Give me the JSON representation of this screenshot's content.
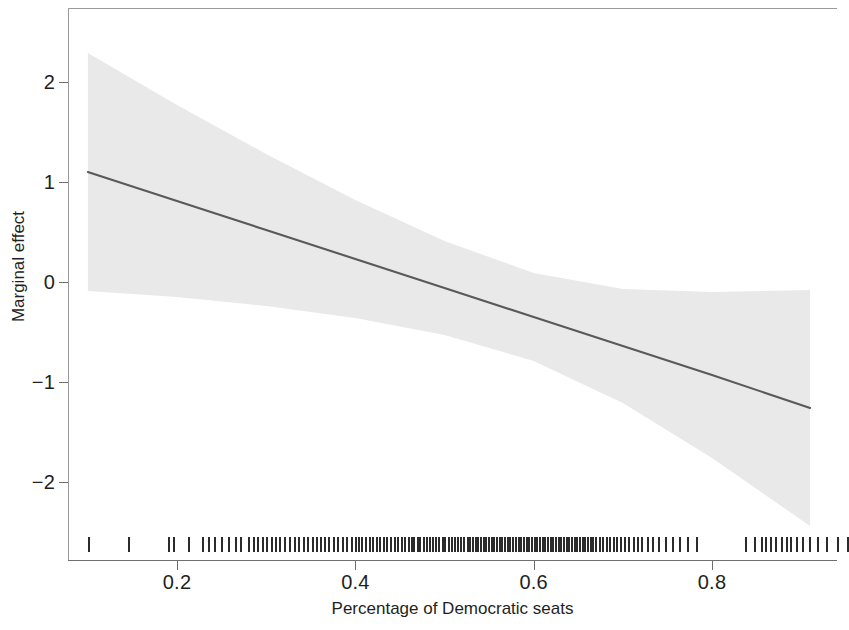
{
  "chart_data": {
    "type": "line",
    "title": "",
    "subtitle": "",
    "xlabel": "Percentage of Democratic seats",
    "ylabel": "Marginal effect",
    "xlim": [
      0.093,
      0.958
    ],
    "ylim": [
      -2.72,
      2.64
    ],
    "xticks": [
      0.2,
      0.4,
      0.6,
      0.8
    ],
    "xtick_labels": [
      "0.2",
      "0.4",
      "0.6",
      "0.8"
    ],
    "yticks": [
      2,
      1,
      0,
      -1,
      -2
    ],
    "ytick_labels": [
      "2",
      "1",
      "0",
      "-1",
      "-2"
    ],
    "grid": false,
    "legend": null,
    "line_color": "#59595b",
    "band_color": "#e9e9e9",
    "series": [
      {
        "name": "Marginal effect",
        "type": "line",
        "x": [
          0.1,
          0.2,
          0.3,
          0.4,
          0.5,
          0.6,
          0.7,
          0.8,
          0.91
        ],
        "values": [
          1.1,
          0.81,
          0.52,
          0.23,
          -0.06,
          -0.35,
          -0.64,
          -0.93,
          -1.26
        ]
      },
      {
        "name": "95% confidence interval upper",
        "type": "band_upper",
        "x": [
          0.1,
          0.2,
          0.3,
          0.4,
          0.5,
          0.6,
          0.7,
          0.8,
          0.91
        ],
        "values": [
          2.29,
          1.77,
          1.28,
          0.82,
          0.41,
          0.09,
          -0.07,
          -0.1,
          -0.08
        ]
      },
      {
        "name": "95% confidence interval lower",
        "type": "band_lower",
        "x": [
          0.1,
          0.2,
          0.3,
          0.4,
          0.5,
          0.6,
          0.7,
          0.8,
          0.91
        ],
        "values": [
          -0.09,
          -0.15,
          -0.24,
          -0.36,
          -0.53,
          -0.79,
          -1.21,
          -1.76,
          -2.44
        ]
      }
    ],
    "rug": {
      "name": "Observation rug",
      "axis": "x",
      "position": "bottom",
      "values": [
        0.101,
        0.146,
        0.191,
        0.197,
        0.213,
        0.229,
        0.236,
        0.243,
        0.251,
        0.258,
        0.266,
        0.272,
        0.281,
        0.286,
        0.291,
        0.296,
        0.301,
        0.306,
        0.311,
        0.316,
        0.321,
        0.327,
        0.332,
        0.337,
        0.342,
        0.347,
        0.352,
        0.357,
        0.361,
        0.366,
        0.371,
        0.376,
        0.381,
        0.386,
        0.391,
        0.396,
        0.401,
        0.404,
        0.408,
        0.412,
        0.416,
        0.42,
        0.424,
        0.428,
        0.432,
        0.436,
        0.44,
        0.444,
        0.448,
        0.452,
        0.456,
        0.46,
        0.463,
        0.466,
        0.47,
        0.473,
        0.477,
        0.48,
        0.484,
        0.487,
        0.491,
        0.494,
        0.498,
        0.501,
        0.505,
        0.508,
        0.512,
        0.515,
        0.519,
        0.522,
        0.526,
        0.529,
        0.532,
        0.535,
        0.538,
        0.541,
        0.544,
        0.547,
        0.55,
        0.553,
        0.556,
        0.559,
        0.562,
        0.565,
        0.568,
        0.571,
        0.574,
        0.577,
        0.58,
        0.583,
        0.586,
        0.589,
        0.592,
        0.595,
        0.598,
        0.601,
        0.604,
        0.607,
        0.61,
        0.613,
        0.616,
        0.619,
        0.622,
        0.625,
        0.628,
        0.631,
        0.634,
        0.637,
        0.64,
        0.643,
        0.646,
        0.649,
        0.652,
        0.655,
        0.658,
        0.661,
        0.664,
        0.667,
        0.67,
        0.674,
        0.678,
        0.682,
        0.686,
        0.69,
        0.694,
        0.698,
        0.702,
        0.707,
        0.712,
        0.717,
        0.722,
        0.728,
        0.734,
        0.741,
        0.748,
        0.756,
        0.764,
        0.773,
        0.783,
        0.838,
        0.848,
        0.856,
        0.861,
        0.866,
        0.872,
        0.878,
        0.884,
        0.889,
        0.895,
        0.902,
        0.91,
        0.919,
        0.929,
        0.941,
        0.953
      ]
    }
  }
}
